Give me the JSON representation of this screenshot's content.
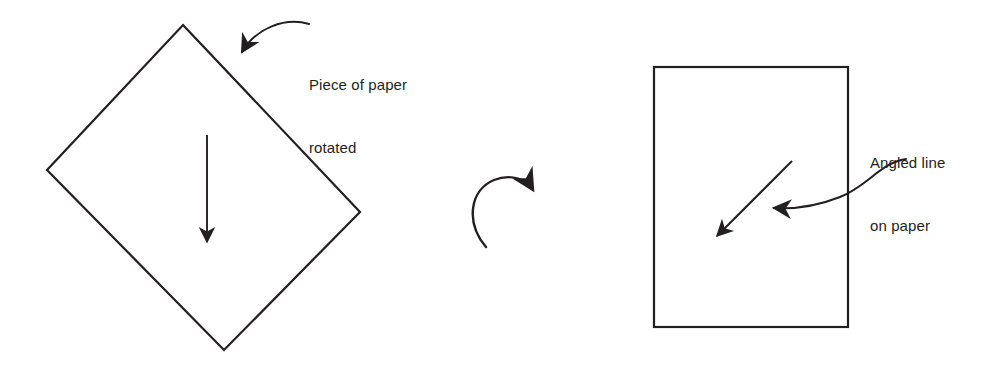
{
  "figure": {
    "background_color": "#ffffff",
    "stroke_color": "#231f20",
    "text_color": "#231f20"
  },
  "labels": {
    "piece_of_paper": {
      "line1": "Piece of paper",
      "line2": "rotated"
    },
    "angled_line": {
      "line1": "Angled line",
      "line2": "on paper"
    }
  },
  "shapes": {
    "diamond": {
      "name": "rotated-square-paper",
      "points": "183,25 360,212 224,350 47,170",
      "stroke_width": 2.2
    },
    "rectangle": {
      "name": "upright-paper",
      "x": 654,
      "y": 67,
      "width": 194,
      "height": 260,
      "stroke_width": 2.2
    }
  },
  "arrows": {
    "down_arrow_in_diamond": {
      "name": "downward-direction-arrow",
      "from_x": 207,
      "from_y": 135,
      "to_x": 207,
      "to_y": 249
    },
    "rotation_arrow": {
      "name": "clockwise-rotation-arrow",
      "start_x": 486,
      "start_y": 246,
      "end_x": 537,
      "end_y": 193
    },
    "diagonal_line_in_rectangle": {
      "name": "angled-line-arrow",
      "from_x": 792,
      "from_y": 161,
      "to_x": 712,
      "to_y": 241
    },
    "callout_piece_of_paper": {
      "name": "callout-arrow-piece-of-paper",
      "start_x": 309,
      "start_y": 24,
      "end_x": 236,
      "end_y": 59
    },
    "callout_angled_line": {
      "name": "callout-arrow-angled-line",
      "start_x": 906,
      "start_y": 159,
      "end_x": 767,
      "end_y": 208
    }
  }
}
